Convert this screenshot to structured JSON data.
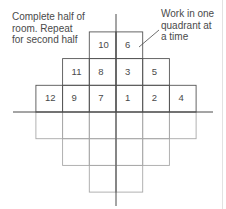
{
  "annotations": {
    "left_note": [
      "Complete half of",
      "room. Repeat",
      "for second half"
    ],
    "right_note": [
      "Work in one",
      "quadrant at",
      "a time"
    ]
  },
  "grid": {
    "cell_size": 26.7,
    "origin": {
      "x": 116,
      "y": 112
    },
    "numbered_cells": [
      {
        "label": "10",
        "col": -1,
        "row": -3
      },
      {
        "label": "6",
        "col": 0,
        "row": -3
      },
      {
        "label": "11",
        "col": -2,
        "row": -2
      },
      {
        "label": "8",
        "col": -1,
        "row": -2
      },
      {
        "label": "3",
        "col": 0,
        "row": -2
      },
      {
        "label": "5",
        "col": 1,
        "row": -2
      },
      {
        "label": "12",
        "col": -3,
        "row": -1
      },
      {
        "label": "9",
        "col": -2,
        "row": -1
      },
      {
        "label": "7",
        "col": -1,
        "row": -1
      },
      {
        "label": "1",
        "col": 0,
        "row": -1
      },
      {
        "label": "2",
        "col": 1,
        "row": -1
      },
      {
        "label": "4",
        "col": 2,
        "row": -1
      }
    ],
    "unnumbered_rows": [
      {
        "row": 0,
        "from_col": -3,
        "to_col": 2
      },
      {
        "row": 1,
        "from_col": -2,
        "to_col": 1
      },
      {
        "row": 2,
        "from_col": -1,
        "to_col": 0
      }
    ]
  },
  "colors": {
    "upper_grid_line": "#555555",
    "lower_grid_line": "#a8a8a8",
    "axis": "#4a4a4a",
    "text": "#4a4a4a"
  }
}
